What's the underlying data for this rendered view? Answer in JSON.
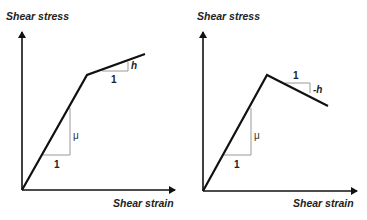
{
  "panels": [
    {
      "id": "hardening",
      "y_axis_label": "Shear stress",
      "x_axis_label": "Shear strain",
      "elastic_slope": {
        "run_label": "1",
        "rise_label": "μ"
      },
      "post_yield_slope": {
        "run_label": "1",
        "rise_label": "h"
      }
    },
    {
      "id": "softening",
      "y_axis_label": "Shear stress",
      "x_axis_label": "Shear strain",
      "elastic_slope": {
        "run_label": "1",
        "rise_label": "μ"
      },
      "post_yield_slope": {
        "run_label": "1",
        "rise_label": "-h"
      }
    }
  ],
  "colors": {
    "curve": "#111111",
    "axis": "#111111",
    "slope_triangle": "#999999"
  }
}
